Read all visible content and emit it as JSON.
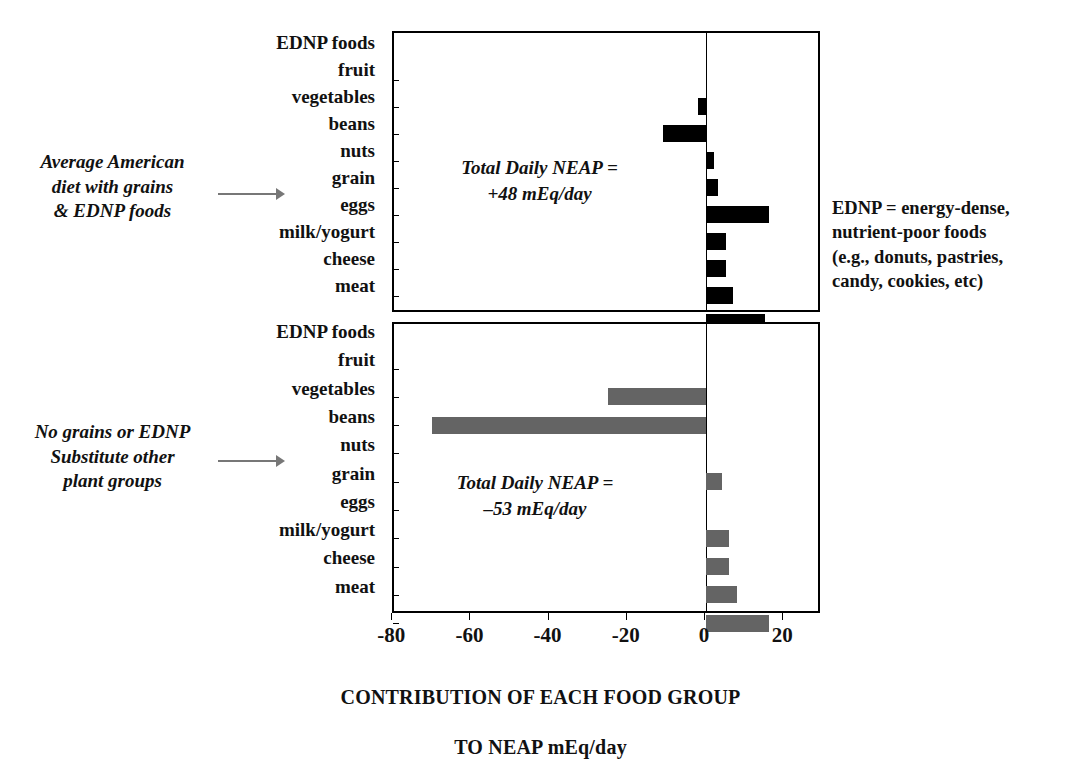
{
  "chart_data": {
    "type": "bar",
    "title": "",
    "xlabel": "CONTRIBUTION OF EACH FOOD GROUP\nTO NEAP mEq/day",
    "ylabel": "",
    "orientation": "horizontal",
    "xlim": [
      -80,
      28.6
    ],
    "xticks": [
      -80,
      -60,
      -40,
      -20,
      0,
      20
    ],
    "xticklabels": [
      "-80",
      "-60",
      "-40",
      "-20",
      "0",
      "20"
    ],
    "grid": false,
    "legend": "none",
    "categories": [
      "EDNP foods",
      "fruit",
      "vegetables",
      "beans",
      "nuts",
      "grain",
      "eggs",
      "milk/yogurt",
      "cheese",
      "meat"
    ],
    "panels": [
      {
        "name": "average-american-diet",
        "annotation": "Average American\ndiet with grains\n& EDNP foods",
        "inner_label": "Total Daily NEAP =\n+48 mEq/day",
        "total_neap": "+48 mEq/day",
        "bar_color": "#000000",
        "values": [
          0,
          -2,
          -11,
          2,
          3,
          16,
          5,
          5,
          7,
          15
        ]
      },
      {
        "name": "no-grains-no-ednp-diet",
        "annotation": "No grains or EDNP\nSubstitute other\nplant groups",
        "inner_label": "Total Daily NEAP =\n–53 mEq/day",
        "total_neap": "–53 mEq/day",
        "bar_color": "#646464",
        "values": [
          0,
          -25,
          -70,
          0,
          4,
          0,
          6,
          6,
          8,
          16
        ]
      }
    ]
  },
  "legend_note": {
    "text": "EDNP = energy-dense,\nnutrient-poor foods\n(e.g., donuts, pastries,\ncandy, cookies, etc)"
  },
  "axis": {
    "title_line1": "CONTRIBUTION OF EACH FOOD GROUP",
    "title_line2": "TO NEAP mEq/day",
    "tick_0": "-80",
    "tick_1": "-60",
    "tick_2": "-40",
    "tick_3": "-20",
    "tick_4": "0",
    "tick_5": "20"
  },
  "categories_top": {
    "c0": "EDNP foods",
    "c1": "fruit",
    "c2": "vegetables",
    "c3": "beans",
    "c4": "nuts",
    "c5": "grain",
    "c6": "eggs",
    "c7": "milk/yogurt",
    "c8": "cheese",
    "c9": "meat"
  },
  "categories_bottom": {
    "c0": "EDNP foods",
    "c1": "fruit",
    "c2": "vegetables",
    "c3": "beans",
    "c4": "nuts",
    "c5": "grain",
    "c6": "eggs",
    "c7": "milk/yogurt",
    "c8": "cheese",
    "c9": "meat"
  },
  "panel_top": {
    "annotation": "Average American\ndiet with grains\n& EDNP foods",
    "inner_label": "Total Daily NEAP =\n+48 mEq/day"
  },
  "panel_bottom": {
    "annotation": "No grains or EDNP\nSubstitute other\nplant groups",
    "inner_label": "Total Daily NEAP =\n–53 mEq/day"
  },
  "colors": {
    "bar_top": "#000000",
    "bar_bottom": "#646464",
    "axis": "#000000",
    "arrow": "#777777"
  }
}
